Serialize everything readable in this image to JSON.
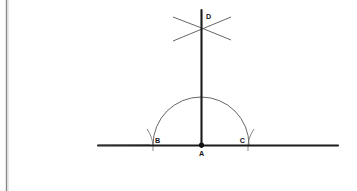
{
  "figure": {
    "background_color": "#ffffff",
    "ink_color": "#1a1a1a",
    "arc_color": "#4a4a4a",
    "margin_rule_color": "#8a8a8a",
    "labels": {
      "A": "A",
      "B": "B",
      "C": "C",
      "D": "D"
    },
    "points": {
      "A": {
        "x": 201,
        "y": 145,
        "label_dx": 0,
        "label_dy": 10
      },
      "B": {
        "x": 152,
        "y": 145,
        "label_dx": 2,
        "label_dy": -3
      },
      "C": {
        "x": 248,
        "y": 145,
        "label_dx": -4,
        "label_dy": -3
      },
      "D": {
        "x": 201,
        "y": 28,
        "label_dx": 4,
        "label_dy": -2
      }
    },
    "baseline": {
      "x1": 98,
      "y1": 145,
      "x2": 338,
      "y2": 145,
      "stroke_width": 2.1
    },
    "vertical_line": {
      "x1": 201,
      "y1": 10,
      "x2": 201,
      "y2": 147,
      "stroke_width": 2.1
    },
    "semicircle": {
      "cx": 201,
      "cy": 145,
      "r": 48,
      "stroke_width": 0.9
    },
    "cross_arc_left": {
      "start_x": 174,
      "start_y": 17,
      "end_x": 230,
      "end_y": 40,
      "sweep": 1
    },
    "cross_arc_right": {
      "start_x": 174,
      "start_y": 40,
      "end_x": 230,
      "end_y": 17,
      "sweep": 0
    },
    "tick_arc_b": {
      "x": 152,
      "y_top": 130,
      "y_bottom": 150
    },
    "tick_arc_c": {
      "x": 248,
      "y_top": 130,
      "y_bottom": 150
    },
    "margin_rule": {
      "x": 6.5,
      "y1": 0,
      "y2": 191,
      "stroke_width": 1.4
    },
    "vertex_dot": {
      "cx": 201,
      "cy": 145,
      "r": 2.6
    }
  }
}
